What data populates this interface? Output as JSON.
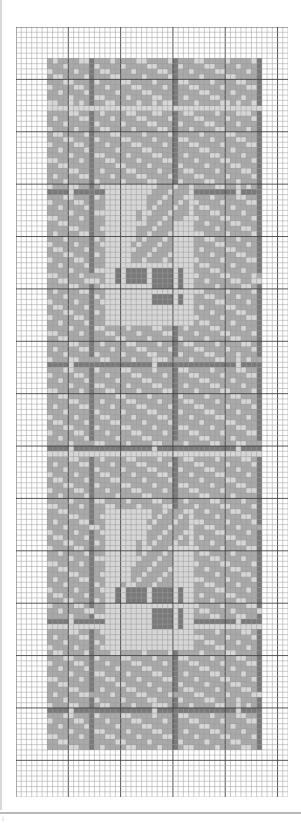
{
  "chart": {
    "type": "cross-stitch-grid",
    "cols": 52,
    "rows": 147,
    "cell_px": 5.23,
    "major_every": 10,
    "colors": {
      "background": "#ffffff",
      "minor_line": "#9a9a9a",
      "major_line": "#444444",
      "light": "#d6d6d6",
      "mid": "#a9a9a9",
      "dark": "#7a7a7a"
    },
    "band": {
      "col_start": 6,
      "col_end": 46,
      "row_start": 6,
      "row_end": 137
    },
    "lattice": {
      "horizontal_rows": [
        15,
        31,
        64,
        80,
        113,
        130
      ],
      "vertical_cols": [
        14,
        30,
        46
      ],
      "light_cross_cols": [
        10,
        26,
        42
      ],
      "light_cross_rows": [
        15,
        48,
        81,
        114
      ]
    },
    "motifs": [
      {
        "name": "acorn-leaf-upper",
        "center_col": 25,
        "center_row": 43
      },
      {
        "name": "acorn-leaf-lower",
        "center_col": 25,
        "center_row": 105
      }
    ]
  },
  "footer": {
    "mark": "i"
  }
}
